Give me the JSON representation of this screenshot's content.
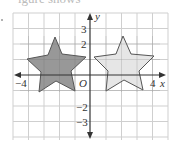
{
  "header": {
    "partial_text": "igure            shows"
  },
  "graph": {
    "axes": {
      "x_label": "x",
      "y_label": "y",
      "origin_label": "O",
      "x_tick_labels": [
        {
          "value": -4,
          "text": "−4"
        },
        {
          "value": 4,
          "text": "4"
        }
      ],
      "y_tick_labels": [
        {
          "value": 3,
          "text": "3"
        },
        {
          "value": 2,
          "text": "2"
        },
        {
          "value": -2,
          "text": "−2"
        },
        {
          "value": -3,
          "text": "−3"
        }
      ],
      "x_range": [
        -5,
        5
      ],
      "y_range": [
        -4,
        4
      ]
    },
    "grid": {
      "on": true,
      "color": "#cfcfcf"
    },
    "shapes": [
      {
        "name": "dark-star",
        "fill": "#8f8f8f",
        "stroke": "#555555",
        "description": "Five-pointed star centered near (-2, 1), original"
      },
      {
        "name": "light-star",
        "fill": "#e3e3e3",
        "stroke": "#555555",
        "description": "Five-pointed star centered near (2, 1), reflection of dark star in y-axis"
      }
    ]
  },
  "colors": {
    "axis": "#333333",
    "grid": "#cfcfcf",
    "dark_fill": "#8f8f8f",
    "light_fill": "#e3e3e3"
  }
}
